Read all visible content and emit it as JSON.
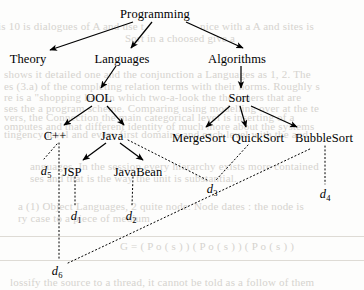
{
  "figure": {
    "type": "directed-graph-with-dependency-edges",
    "background_color": "#fdfdfc",
    "ink_color": "#000000",
    "ghost_color": "#c9c6c0"
  },
  "nodes": [
    {
      "id": "programming",
      "label": "Programming",
      "x": 155,
      "y": 8,
      "level": 0
    },
    {
      "id": "theory",
      "label": "Theory",
      "x": 28,
      "y": 53,
      "level": 1
    },
    {
      "id": "languages",
      "label": "Languages",
      "x": 122,
      "y": 53,
      "level": 1
    },
    {
      "id": "algorithms",
      "label": "Algorithms",
      "x": 237,
      "y": 53,
      "level": 1
    },
    {
      "id": "ool",
      "label": "OOL",
      "x": 99,
      "y": 92,
      "level": 2
    },
    {
      "id": "sort",
      "label": "Sort",
      "x": 239,
      "y": 92,
      "level": 2
    },
    {
      "id": "cpp",
      "label": "C++",
      "x": 55,
      "y": 130,
      "level": 3
    },
    {
      "id": "java",
      "label": "Java",
      "x": 112,
      "y": 130,
      "level": 3
    },
    {
      "id": "mergesort",
      "label": "MergeSort",
      "x": 199,
      "y": 132,
      "level": 3
    },
    {
      "id": "quicksort",
      "label": "QuickSort",
      "x": 258,
      "y": 132,
      "level": 3
    },
    {
      "id": "bubblesort",
      "label": "BubbleSort",
      "x": 324,
      "y": 132,
      "level": 3
    },
    {
      "id": "jsp",
      "label": "JSP",
      "x": 72,
      "y": 166,
      "level": 4
    },
    {
      "id": "javabean",
      "label": "JavaBean",
      "x": 138,
      "y": 166,
      "level": 4
    }
  ],
  "data_nodes": [
    {
      "id": "d5",
      "label": "d",
      "sub": "5",
      "x": 46,
      "y": 165
    },
    {
      "id": "d1",
      "label": "d",
      "sub": "1",
      "x": 76,
      "y": 210
    },
    {
      "id": "d2",
      "label": "d",
      "sub": "2",
      "x": 131,
      "y": 210
    },
    {
      "id": "d3",
      "label": "d",
      "sub": "3",
      "x": 212,
      "y": 183
    },
    {
      "id": "d4",
      "label": "d",
      "sub": "4",
      "x": 325,
      "y": 188
    },
    {
      "id": "d6",
      "label": "d",
      "sub": "6",
      "x": 57,
      "y": 265
    }
  ],
  "edges_arrow": [
    {
      "from": "programming",
      "to": "theory",
      "x1": 133,
      "y1": 22,
      "x2": 50,
      "y2": 50
    },
    {
      "from": "programming",
      "to": "languages",
      "x1": 152,
      "y1": 22,
      "x2": 131,
      "y2": 48
    },
    {
      "from": "programming",
      "to": "algorithms",
      "x1": 186,
      "y1": 22,
      "x2": 243,
      "y2": 48
    },
    {
      "from": "languages",
      "to": "ool",
      "x1": 116,
      "y1": 66,
      "x2": 101,
      "y2": 88
    },
    {
      "from": "algorithms",
      "to": "sort",
      "x1": 241,
      "y1": 66,
      "x2": 241,
      "y2": 88
    },
    {
      "from": "ool",
      "to": "cpp",
      "x1": 92,
      "y1": 106,
      "x2": 64,
      "y2": 125
    },
    {
      "from": "ool",
      "to": "java",
      "x1": 107,
      "y1": 106,
      "x2": 124,
      "y2": 125
    },
    {
      "from": "sort",
      "to": "mergesort",
      "x1": 230,
      "y1": 106,
      "x2": 206,
      "y2": 127
    },
    {
      "from": "sort",
      "to": "quicksort",
      "x1": 240,
      "y1": 106,
      "x2": 246,
      "y2": 127
    },
    {
      "from": "sort",
      "to": "bubblesort",
      "x1": 251,
      "y1": 106,
      "x2": 297,
      "y2": 127
    },
    {
      "from": "java",
      "to": "jsp",
      "x1": 106,
      "y1": 143,
      "x2": 83,
      "y2": 160
    },
    {
      "from": "java",
      "to": "javabean",
      "x1": 120,
      "y1": 143,
      "x2": 143,
      "y2": 160
    }
  ],
  "edges_dotted": [
    {
      "from": "cpp",
      "to": "d5",
      "x1": 57,
      "y1": 144,
      "x2": 44,
      "y2": 159
    },
    {
      "from": "cpp",
      "to": "d6",
      "x1": 59,
      "y1": 143,
      "x2": 59,
      "y2": 260
    },
    {
      "from": "jsp",
      "to": "d1",
      "x1": 75,
      "y1": 177,
      "x2": 75,
      "y2": 205
    },
    {
      "from": "javabean",
      "to": "d2",
      "x1": 133,
      "y1": 177,
      "x2": 132,
      "y2": 205
    },
    {
      "from": "java",
      "to": "d3",
      "x1": 128,
      "y1": 140,
      "x2": 207,
      "y2": 180
    },
    {
      "from": "quicksort",
      "to": "d3",
      "x1": 248,
      "y1": 145,
      "x2": 216,
      "y2": 180
    },
    {
      "from": "bubblesort",
      "to": "d4",
      "x1": 325,
      "y1": 146,
      "x2": 325,
      "y2": 184
    },
    {
      "from": "d6",
      "to": "bubblesort",
      "x1": 68,
      "y1": 263,
      "x2": 312,
      "y2": 148
    }
  ],
  "ghost_text": [
    {
      "text": "is 10 is dialogues of A and use  t",
      "x": -2,
      "y": 20
    },
    {
      "text": "nice with a A and sites is",
      "x": 200,
      "y": 20
    },
    {
      "text": "Sort in a choosed give a",
      "x": 125,
      "y": 32
    },
    {
      "text": "shows it detailed one and the  conjunction a Languages as 1, 2. The",
      "x": 4,
      "y": 68
    },
    {
      "text": "es (3.a) of the completing relation terms with their norms. Roughly s",
      "x": 4,
      "y": 80
    },
    {
      "text": "re is a \"shopping list\" in which two-a-look the the inners that are",
      "x": 4,
      "y": 91
    },
    {
      "text": "ses the a program scheme. Comparing using modelling over at the te",
      "x": 4,
      "y": 102
    },
    {
      "text": "vers, the Connection the main categorical level is inserting of a",
      "x": 4,
      "y": 111
    },
    {
      "text": "omputes and that different identity of much more about the systems",
      "x": 4,
      "y": 120
    },
    {
      "text": "tingency level and every first domains and each level with the and",
      "x": 4,
      "y": 128
    },
    {
      "text": "anguages. In the session every hierarchy exists more contained",
      "x": 30,
      "y": 160
    },
    {
      "text": "ses and that is the way the unit is substantial.",
      "x": 30,
      "y": 172
    },
    {
      "text": "a (1) Object Languages, 2 quite node. Node dates  : the node is",
      "x": 18,
      "y": 200
    },
    {
      "text": "ry case to a piece of medium",
      "x": 18,
      "y": 212
    },
    {
      "text": "G  =  ( P o ( s ) )  ( P o ( s ) )   ( P o ( s ) )",
      "x": 120,
      "y": 240
    },
    {
      "text": "lossify the source to a thread, it cannot be told as a follow of them",
      "x": 10,
      "y": 276
    }
  ]
}
